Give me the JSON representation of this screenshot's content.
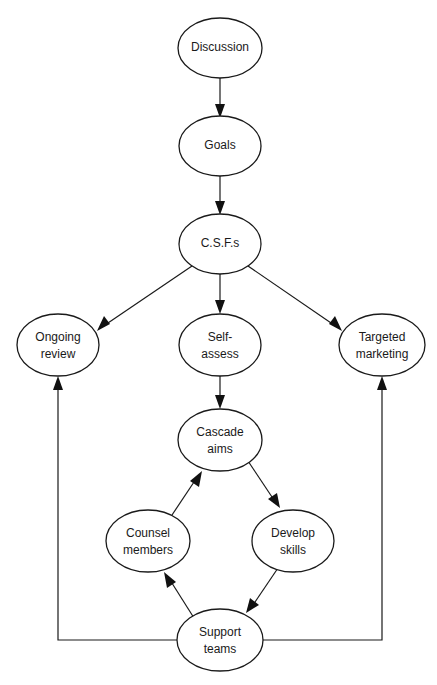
{
  "diagram": {
    "background_color": "#ffffff",
    "stroke_color": "#1a1a1a",
    "arrow_fill": "#111111",
    "width": 437,
    "height": 685,
    "nodes": [
      {
        "id": "discussion",
        "label": "Discussion",
        "line1": "Discussion",
        "line2": "",
        "cx": 220,
        "cy": 48,
        "rx": 42,
        "ry": 30
      },
      {
        "id": "goals",
        "label": "Goals",
        "line1": "Goals",
        "line2": "",
        "cx": 220,
        "cy": 146,
        "rx": 41,
        "ry": 30
      },
      {
        "id": "csfs",
        "label": "C.S.F.s",
        "line1": "C.S.F.s",
        "line2": "",
        "cx": 220,
        "cy": 244,
        "rx": 41,
        "ry": 30
      },
      {
        "id": "ongoing-review",
        "label": "Ongoing review",
        "line1": "Ongoing",
        "line2": "review",
        "cx": 58,
        "cy": 345,
        "rx": 41,
        "ry": 31
      },
      {
        "id": "self-assess",
        "label": "Self-assess",
        "line1": "Self-",
        "line2": "assess",
        "cx": 220,
        "cy": 345,
        "rx": 41,
        "ry": 31
      },
      {
        "id": "targeted-marketing",
        "label": "Targeted marketing",
        "line1": "Targeted",
        "line2": "marketing",
        "cx": 382,
        "cy": 345,
        "rx": 43,
        "ry": 31
      },
      {
        "id": "cascade-aims",
        "label": "Cascade aims",
        "line1": "Cascade",
        "line2": "aims",
        "cx": 220,
        "cy": 440,
        "rx": 42,
        "ry": 31
      },
      {
        "id": "counsel-members",
        "label": "Counsel members",
        "line1": "Counsel",
        "line2": "members",
        "cx": 148,
        "cy": 541,
        "rx": 42,
        "ry": 31
      },
      {
        "id": "develop-skills",
        "label": "Develop skills",
        "line1": "Develop",
        "line2": "skills",
        "cx": 293,
        "cy": 541,
        "rx": 41,
        "ry": 31
      },
      {
        "id": "support-teams",
        "label": "Support teams",
        "line1": "Support",
        "line2": "teams",
        "cx": 220,
        "cy": 640,
        "rx": 43,
        "ry": 31
      }
    ],
    "edges": [
      {
        "id": "discussion-to-goals",
        "from": "Discussion",
        "to": "Goals",
        "kind": "straight"
      },
      {
        "id": "goals-to-csfs",
        "from": "Goals",
        "to": "C.S.F.s",
        "kind": "straight"
      },
      {
        "id": "csfs-to-ongoing-review",
        "from": "C.S.F.s",
        "to": "Ongoing review",
        "kind": "diagonal"
      },
      {
        "id": "csfs-to-self-assess",
        "from": "C.S.F.s",
        "to": "Self-assess",
        "kind": "straight"
      },
      {
        "id": "csfs-to-targeted-marketing",
        "from": "C.S.F.s",
        "to": "Targeted marketing",
        "kind": "diagonal"
      },
      {
        "id": "self-assess-to-cascade-aims",
        "from": "Self-assess",
        "to": "Cascade aims",
        "kind": "straight"
      },
      {
        "id": "cascade-aims-to-develop-skills",
        "from": "Cascade aims",
        "to": "Develop skills",
        "kind": "diagonal"
      },
      {
        "id": "develop-skills-to-support-teams",
        "from": "Develop skills",
        "to": "Support teams",
        "kind": "diagonal"
      },
      {
        "id": "support-teams-to-counsel-members",
        "from": "Support teams",
        "to": "Counsel members",
        "kind": "diagonal"
      },
      {
        "id": "counsel-members-to-cascade-aims",
        "from": "Counsel members",
        "to": "Cascade aims",
        "kind": "diagonal"
      },
      {
        "id": "support-teams-to-ongoing-review",
        "from": "Support teams",
        "to": "Ongoing review",
        "kind": "orthogonal-left-feedback"
      },
      {
        "id": "support-teams-to-targeted-marketing",
        "from": "Support teams",
        "to": "Targeted marketing",
        "kind": "orthogonal-right-feedback"
      }
    ]
  }
}
